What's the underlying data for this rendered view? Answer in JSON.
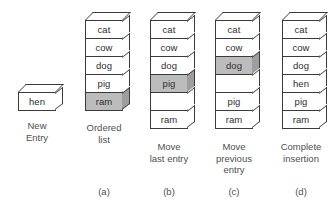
{
  "figure": {
    "background": "#ffffff",
    "shaded_color": "#bcbcbc",
    "shaded_side_color": "#9e9e9e",
    "line_color": "#3a3a3a",
    "text_color": "#2f2f2f",
    "caption_color": "#4f4f4f"
  },
  "panels": [
    {
      "id": "new-entry",
      "caption": "New\nEntry",
      "panel_label": "",
      "cells": [
        {
          "label": "hen",
          "shaded": false
        }
      ]
    },
    {
      "id": "ordered-list",
      "caption": "Ordered\nlist",
      "panel_label": "(a)",
      "cells": [
        {
          "label": "cat",
          "shaded": false
        },
        {
          "label": "cow",
          "shaded": false
        },
        {
          "label": "dog",
          "shaded": false
        },
        {
          "label": "pig",
          "shaded": false
        },
        {
          "label": "ram",
          "shaded": true
        }
      ]
    },
    {
      "id": "move-last-entry",
      "caption": "Move\nlast entry",
      "panel_label": "(b)",
      "cells": [
        {
          "label": "cat",
          "shaded": false
        },
        {
          "label": "cow",
          "shaded": false
        },
        {
          "label": "dog",
          "shaded": false
        },
        {
          "label": "pig",
          "shaded": true
        },
        {
          "label": "",
          "shaded": false
        },
        {
          "label": "ram",
          "shaded": false
        }
      ]
    },
    {
      "id": "move-previous-entry",
      "caption": "Move\nprevious\nentry",
      "panel_label": "(c)",
      "cells": [
        {
          "label": "cat",
          "shaded": false
        },
        {
          "label": "cow",
          "shaded": false
        },
        {
          "label": "dog",
          "shaded": true
        },
        {
          "label": "",
          "shaded": false
        },
        {
          "label": "pig",
          "shaded": false
        },
        {
          "label": "ram",
          "shaded": false
        }
      ]
    },
    {
      "id": "complete-insertion",
      "caption": "Complete\ninsertion",
      "panel_label": "(d)",
      "cells": [
        {
          "label": "cat",
          "shaded": false
        },
        {
          "label": "cow",
          "shaded": false
        },
        {
          "label": "dog",
          "shaded": false
        },
        {
          "label": "hen",
          "shaded": false
        },
        {
          "label": "pig",
          "shaded": false
        },
        {
          "label": "ram",
          "shaded": false
        }
      ]
    }
  ]
}
